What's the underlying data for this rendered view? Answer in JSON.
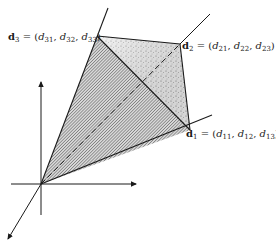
{
  "diagram": {
    "type": "vector-cone-3d",
    "axes": {
      "count": 3,
      "arrows": [
        "up",
        "right",
        "down-left"
      ]
    },
    "vectors": [
      {
        "id": "d1",
        "label_bold": "d",
        "label_sub": "1",
        "equals": "=",
        "components": [
          "d11",
          "d12",
          "d13"
        ],
        "comp_base": "d",
        "comp_subs": [
          "11",
          "12",
          "13"
        ]
      },
      {
        "id": "d2",
        "label_bold": "d",
        "label_sub": "2",
        "equals": "=",
        "components": [
          "d21",
          "d22",
          "d23"
        ],
        "comp_base": "d",
        "comp_subs": [
          "21",
          "22",
          "23"
        ]
      },
      {
        "id": "d3",
        "label_bold": "d",
        "label_sub": "3",
        "equals": "=",
        "components": [
          "d31",
          "d32",
          "d33"
        ],
        "comp_base": "d",
        "comp_subs": [
          "31",
          "32",
          "33"
        ]
      }
    ],
    "faces": [
      {
        "name": "face-origin-d1-d3",
        "fill": "hatched"
      },
      {
        "name": "face-d1-d2-d3",
        "fill": "stippled"
      }
    ],
    "colors": {
      "ink": "#1a1a1a",
      "hatch": "#555555",
      "stipple": "#777777",
      "background": "#ffffff"
    }
  }
}
